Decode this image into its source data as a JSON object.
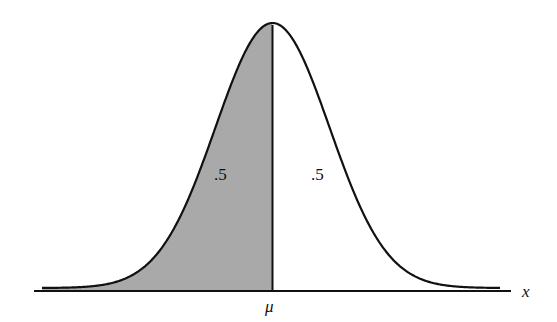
{
  "chart_data": {
    "type": "area",
    "title": "",
    "xlabel": "x",
    "ylabel": "",
    "axis_ticks": [
      "μ"
    ],
    "regions": [
      {
        "name": "left-half",
        "range": [
          "-inf",
          "μ"
        ],
        "area": 0.5,
        "shaded": true,
        "label": ".5"
      },
      {
        "name": "right-half",
        "range": [
          "μ",
          "+inf"
        ],
        "area": 0.5,
        "shaded": false,
        "label": ".5"
      }
    ],
    "distribution": "normal",
    "grid": false,
    "legend": false
  },
  "labels": {
    "left_area": ".5",
    "right_area": ".5",
    "mean": "μ",
    "x_axis": "x"
  },
  "colors": {
    "shade": "#a9a9a9",
    "line": "#111111",
    "background": "#ffffff"
  }
}
